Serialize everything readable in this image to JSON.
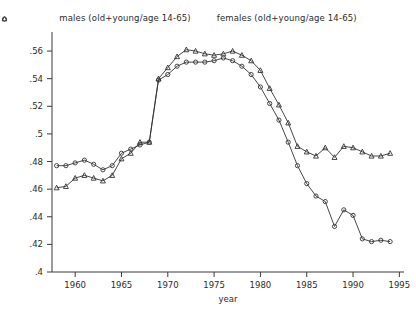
{
  "legend": {
    "entries": [
      {
        "marker": "circle-icon",
        "label": "males (old+young/age 14-65)"
      },
      {
        "marker": "triangle-icon",
        "label": "females (old+young/age 14-65)"
      }
    ]
  },
  "chart_data": {
    "type": "line",
    "title": "",
    "xlabel": "year",
    "ylabel": "",
    "xlim": [
      1957.5,
      1995.5
    ],
    "ylim": [
      0.4,
      0.568
    ],
    "grid": false,
    "legend_position": "top-center",
    "xticks": [
      1960,
      1965,
      1970,
      1975,
      1980,
      1985,
      1990,
      1995
    ],
    "xtick_labels": [
      "1960",
      "1965",
      "1970",
      "1975",
      "1980",
      "1985",
      "1990",
      "1995"
    ],
    "yticks": [
      0.4,
      0.42,
      0.44,
      0.46,
      0.48,
      0.5,
      0.52,
      0.54,
      0.56
    ],
    "ytick_labels": [
      ".4",
      ".42",
      ".44",
      ".46",
      ".48",
      ".5",
      ".52",
      ".54",
      ".56"
    ],
    "x": [
      1958,
      1959,
      1960,
      1961,
      1962,
      1963,
      1964,
      1965,
      1966,
      1967,
      1968,
      1969,
      1970,
      1971,
      1972,
      1973,
      1974,
      1975,
      1976,
      1977,
      1978,
      1979,
      1980,
      1981,
      1982,
      1983,
      1984,
      1985,
      1986,
      1987,
      1988,
      1989,
      1990,
      1991,
      1992,
      1993,
      1994
    ],
    "series": [
      {
        "name": "males (old+young/age 14-65)",
        "marker": "circle",
        "values": [
          0.477,
          0.477,
          0.479,
          0.481,
          0.478,
          0.474,
          0.477,
          0.486,
          0.489,
          0.492,
          0.494,
          0.539,
          0.543,
          0.549,
          0.552,
          0.552,
          0.552,
          0.553,
          0.555,
          0.553,
          0.549,
          0.543,
          0.534,
          0.522,
          0.51,
          0.494,
          0.477,
          0.464,
          0.455,
          0.451,
          0.433,
          0.445,
          0.441,
          0.424,
          0.422,
          0.423,
          0.422
        ]
      },
      {
        "name": "females (old+young/age 14-65)",
        "marker": "triangle",
        "values": [
          0.461,
          0.462,
          0.468,
          0.47,
          0.468,
          0.466,
          0.47,
          0.482,
          0.486,
          0.494,
          0.494,
          0.54,
          0.548,
          0.556,
          0.561,
          0.56,
          0.558,
          0.557,
          0.558,
          0.56,
          0.557,
          0.553,
          0.546,
          0.533,
          0.521,
          0.508,
          0.491,
          0.487,
          0.484,
          0.49,
          0.483,
          0.491,
          0.49,
          0.487,
          0.484,
          0.484,
          0.486
        ]
      }
    ]
  }
}
